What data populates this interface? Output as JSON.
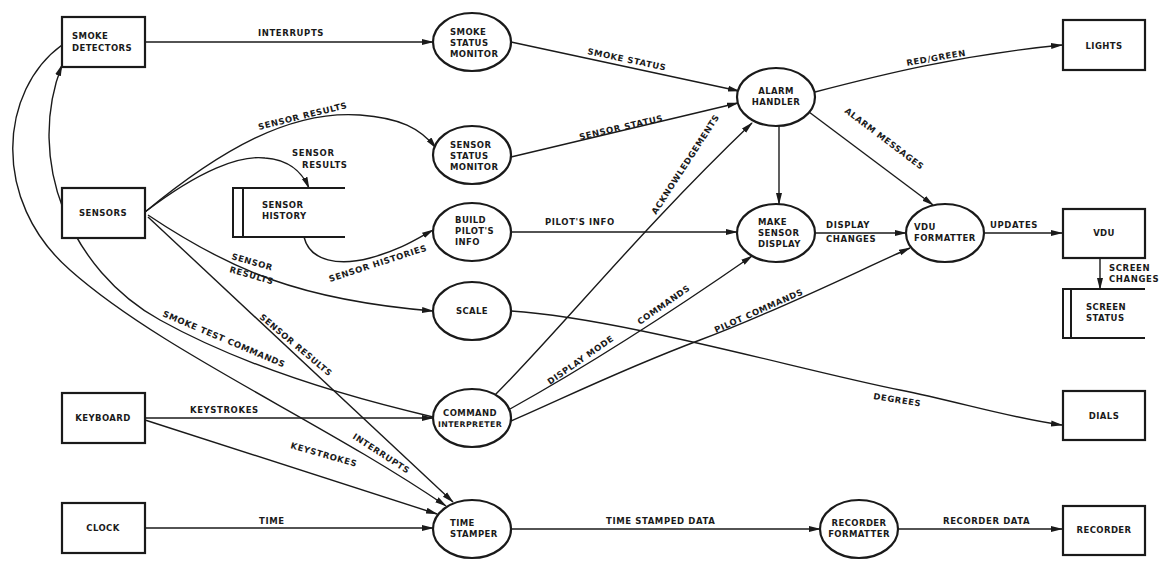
{
  "diagram": {
    "type": "data-flow-diagram",
    "colors": {
      "ink": "#1a1a1a",
      "background": "#ffffff"
    },
    "terminators": [
      {
        "id": "smoke_detectors",
        "lines": [
          "SMOKE",
          "DETECTORS"
        ],
        "x": 62,
        "y": 17,
        "w": 83,
        "h": 50
      },
      {
        "id": "sensors",
        "lines": [
          "SENSORS"
        ],
        "x": 62,
        "y": 188,
        "w": 83,
        "h": 50
      },
      {
        "id": "keyboard",
        "lines": [
          "KEYBOARD"
        ],
        "x": 62,
        "y": 393,
        "w": 83,
        "h": 50
      },
      {
        "id": "clock",
        "lines": [
          "CLOCK"
        ],
        "x": 62,
        "y": 503,
        "w": 83,
        "h": 50
      },
      {
        "id": "lights",
        "lines": [
          "LIGHTS"
        ],
        "x": 1063,
        "y": 20,
        "w": 82,
        "h": 50
      },
      {
        "id": "vdu",
        "lines": [
          "VDU"
        ],
        "x": 1063,
        "y": 209,
        "w": 82,
        "h": 49
      },
      {
        "id": "dials",
        "lines": [
          "DIALS"
        ],
        "x": 1063,
        "y": 391,
        "w": 82,
        "h": 49
      },
      {
        "id": "recorder",
        "lines": [
          "RECORDER"
        ],
        "x": 1063,
        "y": 506,
        "w": 82,
        "h": 49
      }
    ],
    "processes": [
      {
        "id": "smoke_status_monitor",
        "lines": [
          "SMOKE",
          "STATUS",
          "MONITOR"
        ],
        "cx": 472,
        "cy": 42,
        "rx": 39,
        "ry": 29
      },
      {
        "id": "sensor_status_monitor",
        "lines": [
          "SENSOR",
          "STATUS",
          "MONITOR"
        ],
        "cx": 472,
        "cy": 155,
        "rx": 39,
        "ry": 29
      },
      {
        "id": "build_pilots_info",
        "lines": [
          "BUILD",
          "PILOT'S",
          "INFO"
        ],
        "cx": 472,
        "cy": 232,
        "rx": 39,
        "ry": 29
      },
      {
        "id": "scale",
        "lines": [
          "SCALE"
        ],
        "cx": 472,
        "cy": 311,
        "rx": 39,
        "ry": 29
      },
      {
        "id": "command_interpreter",
        "lines": [
          "COMMAND",
          "INTERPRETER"
        ],
        "cx": 472,
        "cy": 418,
        "rx": 39,
        "ry": 29
      },
      {
        "id": "time_stamper",
        "lines": [
          "TIME",
          "STAMPER"
        ],
        "cx": 472,
        "cy": 529,
        "rx": 39,
        "ry": 29
      },
      {
        "id": "alarm_handler",
        "lines": [
          "ALARM",
          "HANDLER"
        ],
        "cx": 776,
        "cy": 97,
        "rx": 39,
        "ry": 29
      },
      {
        "id": "make_sensor_display",
        "lines": [
          "MAKE",
          "SENSOR",
          "DISPLAY"
        ],
        "cx": 776,
        "cy": 233,
        "rx": 39,
        "ry": 29
      },
      {
        "id": "vdu_formatter",
        "lines": [
          "VDU",
          "FORMATTER"
        ],
        "cx": 945,
        "cy": 233,
        "rx": 39,
        "ry": 29
      },
      {
        "id": "recorder_formatter",
        "lines": [
          "RECORDER",
          "FORMATTER"
        ],
        "cx": 859,
        "cy": 529,
        "rx": 39,
        "ry": 29
      }
    ],
    "data_stores": [
      {
        "id": "sensor_history",
        "lines": [
          "SENSOR",
          "HISTORY"
        ],
        "x": 233,
        "y": 188,
        "w": 112,
        "h": 49
      },
      {
        "id": "screen_status",
        "lines": [
          "SCREEN",
          "STATUS"
        ],
        "x": 1063,
        "y": 289,
        "w": 82,
        "h": 49
      }
    ],
    "flows": [
      {
        "id": "f_interrupts_smoke",
        "label": "INTERRUPTS",
        "from": "SMOKE DETECTORS",
        "to": "SMOKE STATUS MONITOR"
      },
      {
        "id": "f_smoke_status",
        "label": "SMOKE STATUS",
        "from": "SMOKE STATUS MONITOR",
        "to": "ALARM HANDLER"
      },
      {
        "id": "f_sensor_results_ssm",
        "label": "SENSOR RESULTS",
        "from": "SENSORS",
        "to": "SENSOR STATUS MONITOR"
      },
      {
        "id": "f_sensor_status",
        "label": "SENSOR STATUS",
        "from": "SENSOR STATUS MONITOR",
        "to": "ALARM HANDLER"
      },
      {
        "id": "f_sensor_results_hist",
        "label": "SENSOR RESULTS",
        "from": "SENSORS",
        "to": "SENSOR HISTORY"
      },
      {
        "id": "f_sensor_histories",
        "label": "SENSOR HISTORIES",
        "from": "SENSOR HISTORY",
        "to": "BUILD PILOT'S INFO"
      },
      {
        "id": "f_pilots_info",
        "label": "PILOT'S INFO",
        "from": "BUILD PILOT'S INFO",
        "to": "MAKE SENSOR DISPLAY"
      },
      {
        "id": "f_sensor_results_scale",
        "label": "SENSOR RESULTS",
        "from": "SENSORS",
        "to": "SCALE"
      },
      {
        "id": "f_degrees",
        "label": "DEGREES",
        "from": "SCALE",
        "to": "DIALS"
      },
      {
        "id": "f_sensor_results_ts",
        "label": "SENSOR RESULTS",
        "from": "SENSORS",
        "to": "TIME STAMPER"
      },
      {
        "id": "f_smoke_test_commands",
        "label": "SMOKE TEST COMMANDS",
        "from": "COMMAND INTERPRETER",
        "to": "SMOKE DETECTORS"
      },
      {
        "id": "f_interrupts_ts",
        "label": "INTERRUPTS",
        "from": "SMOKE DETECTORS",
        "to": "TIME STAMPER"
      },
      {
        "id": "f_keystrokes_ci",
        "label": "KEYSTROKES",
        "from": "KEYBOARD",
        "to": "COMMAND INTERPRETER"
      },
      {
        "id": "f_keystrokes_ts",
        "label": "KEYSTROKES",
        "from": "KEYBOARD",
        "to": "TIME STAMPER"
      },
      {
        "id": "f_time",
        "label": "TIME",
        "from": "CLOCK",
        "to": "TIME STAMPER"
      },
      {
        "id": "f_acknowledgements",
        "label": "ACKNOWLEDGEMENTS",
        "from": "COMMAND INTERPRETER",
        "to": "ALARM HANDLER"
      },
      {
        "id": "f_display_mode_commands",
        "label": "DISPLAY MODE  COMMANDS",
        "from": "COMMAND INTERPRETER",
        "to": "MAKE SENSOR DISPLAY"
      },
      {
        "id": "f_pilot_commands",
        "label": "PILOT COMMANDS",
        "from": "COMMAND INTERPRETER",
        "to": "VDU FORMATTER"
      },
      {
        "id": "f_alarm_to_display",
        "label": "",
        "from": "ALARM HANDLER",
        "to": "MAKE SENSOR DISPLAY"
      },
      {
        "id": "f_red_green",
        "label": "RED/GREEN",
        "from": "ALARM HANDLER",
        "to": "LIGHTS"
      },
      {
        "id": "f_alarm_messages",
        "label": "ALARM MESSAGES",
        "from": "ALARM HANDLER",
        "to": "VDU FORMATTER"
      },
      {
        "id": "f_display_changes",
        "label": "DISPLAY CHANGES",
        "from": "MAKE SENSOR DISPLAY",
        "to": "VDU FORMATTER"
      },
      {
        "id": "f_updates",
        "label": "UPDATES",
        "from": "VDU FORMATTER",
        "to": "VDU"
      },
      {
        "id": "f_screen_changes",
        "label": "SCREEN CHANGES",
        "from": "VDU",
        "to": "SCREEN STATUS"
      },
      {
        "id": "f_time_stamped_data",
        "label": "TIME STAMPED DATA",
        "from": "TIME STAMPER",
        "to": "RECORDER FORMATTER"
      },
      {
        "id": "f_recorder_data",
        "label": "RECORDER DATA",
        "from": "RECORDER FORMATTER",
        "to": "RECORDER"
      }
    ]
  },
  "labels": {
    "interrupts_top": "INTERRUPTS",
    "smoke_status": "SMOKE STATUS",
    "sensor_results_1": "SENSOR RESULTS",
    "sensor_status": "SENSOR STATUS",
    "sensor_results_2a": "SENSOR",
    "sensor_results_2b": "RESULTS",
    "sensor_histories": "SENSOR HISTORIES",
    "pilots_info": "PILOT'S INFO",
    "sensor_results_3a": "SENSOR",
    "sensor_results_3b": "RESULTS",
    "smoke_test_commands": "SMOKE TEST COMMANDS",
    "sensor_results_4": "SENSOR RESULTS",
    "keystrokes_1": "KEYSTROKES",
    "keystrokes_2": "KEYSTROKES",
    "interrupts_bottom": "INTERRUPTS",
    "time": "TIME",
    "time_stamped_data": "TIME STAMPED DATA",
    "recorder_data": "RECORDER DATA",
    "acknowledgements": "ACKNOWLEDGEMENTS",
    "display_mode": "DISPLAY MODE",
    "commands": "COMMANDS",
    "pilot_commands": "PILOT COMMANDS",
    "degrees": "DEGREES",
    "red_green": "RED/GREEN",
    "alarm_messages": "ALARM MESSAGES",
    "display_changes_a": "DISPLAY",
    "display_changes_b": "CHANGES",
    "updates": "UPDATES",
    "screen_changes_a": "SCREEN",
    "screen_changes_b": "CHANGES"
  },
  "nodes": {
    "smoke_detectors": [
      "SMOKE",
      "DETECTORS"
    ],
    "sensors": "SENSORS",
    "keyboard": "KEYBOARD",
    "clock": "CLOCK",
    "lights": "LIGHTS",
    "vdu": "VDU",
    "dials": "DIALS",
    "recorder": "RECORDER",
    "smoke_status_monitor": [
      "SMOKE",
      "STATUS",
      "MONITOR"
    ],
    "sensor_status_monitor": [
      "SENSOR",
      "STATUS",
      "MONITOR"
    ],
    "build_pilots_info": [
      "BUILD",
      "PILOT'S",
      "INFO"
    ],
    "scale": "SCALE",
    "command_interpreter": [
      "COMMAND",
      "INTERPRETER"
    ],
    "time_stamper": [
      "TIME",
      "STAMPER"
    ],
    "alarm_handler": [
      "ALARM",
      "HANDLER"
    ],
    "make_sensor_display": [
      "MAKE",
      "SENSOR",
      "DISPLAY"
    ],
    "vdu_formatter": [
      "VDU",
      "FORMATTER"
    ],
    "recorder_formatter": [
      "RECORDER",
      "FORMATTER"
    ],
    "sensor_history": [
      "SENSOR",
      "HISTORY"
    ],
    "screen_status": [
      "SCREEN",
      "STATUS"
    ]
  }
}
